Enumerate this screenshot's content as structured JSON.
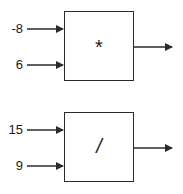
{
  "diagram": {
    "blocks": [
      {
        "operator": "*",
        "inputs": [
          {
            "label": "-8"
          },
          {
            "label": "6"
          }
        ],
        "has_output": true
      },
      {
        "operator": "/",
        "inputs": [
          {
            "label": "15"
          },
          {
            "label": "9"
          }
        ],
        "has_output": true
      }
    ],
    "stroke_color": "#2a2a2a"
  }
}
